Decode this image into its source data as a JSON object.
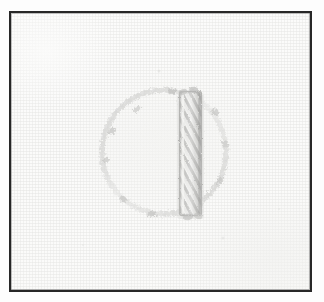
{
  "image": {
    "kind": "embroidery-sample-scan",
    "caption": "",
    "width": 324,
    "height": 302,
    "background_color": "#fdfdfd"
  },
  "frame": {
    "name": "plate-border",
    "border_color": "#272727",
    "border_width_px": 2,
    "x": 9,
    "y": 11,
    "width": 303,
    "height": 281
  },
  "fabric": {
    "color": "#fbfbfa",
    "weave_color": "#e4e4e2",
    "description": "plain woven white linen ground"
  },
  "motif": {
    "name": "circle-with-vertical-bar",
    "circle": {
      "name": "stitched-circle-outline",
      "center_x": 162,
      "center_y": 150,
      "radius": 62,
      "stitch": "chain-stitch",
      "thread_color": "#c9c9c7",
      "line_weight_px": 4
    },
    "bar": {
      "name": "vertical-satin-bar",
      "x": 177,
      "y": 90,
      "width": 23,
      "height": 124,
      "stitch": "raised-satin-stitch",
      "thread_color": "#b4b4b2",
      "highlight_color": "#f2f2f0",
      "slant_degrees": 62
    }
  }
}
